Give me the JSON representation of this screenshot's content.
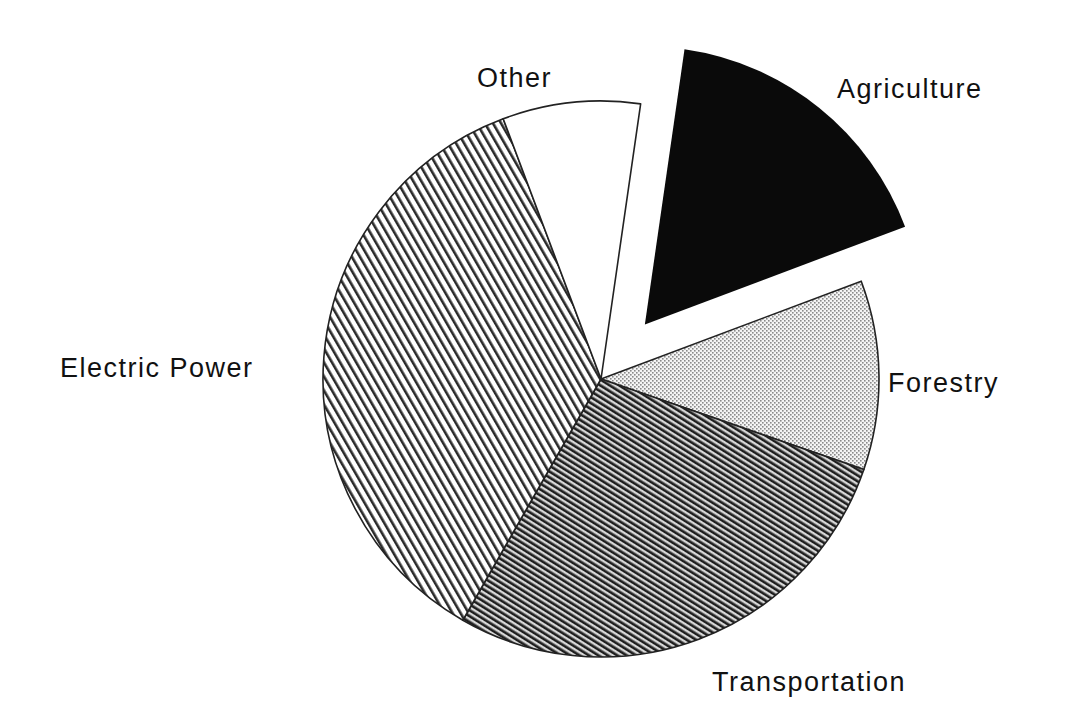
{
  "chart_data": {
    "type": "pie",
    "title": "",
    "start_angle_deg_clockwise_from_top": 8.2,
    "categories": [
      "Agriculture",
      "Forestry",
      "Transportation",
      "Electric Power",
      "Other"
    ],
    "values": [
      17,
      11,
      28,
      36,
      8
    ],
    "exploded": [
      "Agriculture"
    ],
    "patterns": {
      "Agriculture": "solid-black",
      "Forestry": "fine-dots",
      "Transportation": "dense-diagonal-hatch",
      "Electric Power": "sparse-diagonal-hatch",
      "Other": "white"
    },
    "legend": "none (direct labels)",
    "labels": {
      "Agriculture": "Agriculture",
      "Forestry": "Forestry",
      "Transportation": "Transportation",
      "Electric Power": "Electric Power",
      "Other": "Other"
    }
  },
  "colors": {
    "background": "#ffffff",
    "ink": "#111111"
  }
}
